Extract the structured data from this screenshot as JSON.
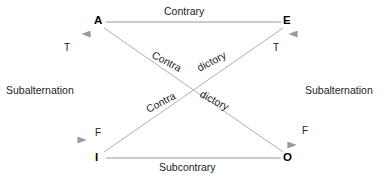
{
  "diagram": {
    "colors": {
      "background": "#ffffff",
      "line": "#9a9a9a",
      "arrow": "#9a9a9a",
      "text": "#1c1c1c",
      "vertex_text": "#000000"
    },
    "vertices": [
      {
        "id": "A",
        "label": "A",
        "x": 98,
        "y": 22
      },
      {
        "id": "E",
        "label": "E",
        "x": 287,
        "y": 22
      },
      {
        "id": "I",
        "label": "I",
        "x": 98,
        "y": 158
      },
      {
        "id": "O",
        "label": "O",
        "x": 288,
        "y": 158
      }
    ],
    "relations": {
      "top": "Contrary",
      "bottom": "Subcontrary",
      "left": "Subalternation",
      "right": "Subalternation",
      "diagonal_word_part_1": "Contra",
      "diagonal_word_part_2": "dictory"
    },
    "diagonal_labels": [
      {
        "text": "Contra",
        "position": "upper-left",
        "direction": "down"
      },
      {
        "text": "dictory",
        "position": "upper-right",
        "direction": "up"
      },
      {
        "text": "Contra",
        "position": "lower-left",
        "direction": "up"
      },
      {
        "text": "dictory",
        "position": "lower-right",
        "direction": "down"
      }
    ],
    "truth_values": [
      {
        "label": "T",
        "side": "left",
        "position": "top"
      },
      {
        "label": "F",
        "side": "left",
        "position": "bottom"
      },
      {
        "label": "T",
        "side": "right",
        "position": "top"
      },
      {
        "label": "F",
        "side": "right",
        "position": "bottom"
      }
    ]
  }
}
